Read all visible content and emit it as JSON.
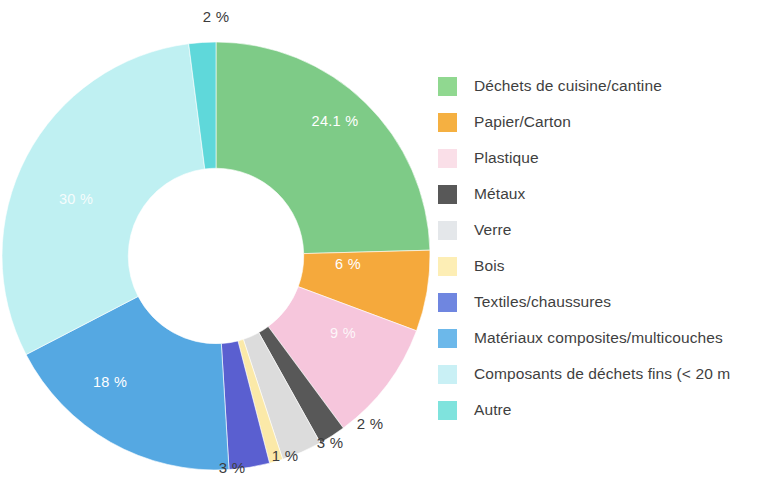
{
  "chart_data": {
    "type": "pie",
    "variant": "donut",
    "title": "",
    "subtitle": "",
    "xlabel": "",
    "ylabel": "",
    "units": "%",
    "legend_position": "right",
    "grid": false,
    "start_angle_deg": 0,
    "direction": "clockwise",
    "inner_radius_ratio": 0.41,
    "categories": [
      "Déchets de cuisine/cantine",
      "Papier/Carton",
      "Plastique",
      "Métaux",
      "Verre",
      "Bois",
      "Textiles/chaussures",
      "Matériaux composites/multicouches",
      "Composants de déchets fins (< 20 m",
      "Autre"
    ],
    "values": [
      24.1,
      6,
      9,
      2,
      3,
      1,
      3,
      18,
      30,
      2
    ],
    "data_labels": [
      "24.1 %",
      "6 %",
      "9 %",
      "2 %",
      "3 %",
      "1 %",
      "3 %",
      "18 %",
      "30 %",
      "2 %"
    ],
    "colors": [
      "#7ecb87",
      "#f5a93c",
      "#f6c6dc",
      "#585858",
      "#dcdcdc",
      "#fbe9a8",
      "#5a5fd0",
      "#55a8e2",
      "#bff0f2",
      "#5fd8da"
    ],
    "slices": [
      {
        "label": "Déchets de cuisine/cantine",
        "value": 24.1,
        "data_label": "24.1 %",
        "color": "#7ecb87",
        "label_placement": "inside"
      },
      {
        "label": "Papier/Carton",
        "value": 6,
        "data_label": "6 %",
        "color": "#f5a93c",
        "label_placement": "inside"
      },
      {
        "label": "Plastique",
        "value": 9,
        "data_label": "9 %",
        "color": "#f6c6dc",
        "label_placement": "inside"
      },
      {
        "label": "Métaux",
        "value": 2,
        "data_label": "2 %",
        "color": "#585858",
        "label_placement": "outside"
      },
      {
        "label": "Verre",
        "value": 3,
        "data_label": "3 %",
        "color": "#dcdcdc",
        "label_placement": "outside"
      },
      {
        "label": "Bois",
        "value": 1,
        "data_label": "1 %",
        "color": "#fbe9a8",
        "label_placement": "outside"
      },
      {
        "label": "Textiles/chaussures",
        "value": 3,
        "data_label": "3 %",
        "color": "#5a5fd0",
        "label_placement": "outside"
      },
      {
        "label": "Matériaux composites/multicouches",
        "value": 18,
        "data_label": "18 %",
        "color": "#55a8e2",
        "label_placement": "inside"
      },
      {
        "label": "Composants de déchets fins (< 20 m",
        "value": 30,
        "data_label": "30 %",
        "color": "#bff0f2",
        "label_placement": "inside"
      },
      {
        "label": "Autre",
        "value": 2,
        "data_label": "2 %",
        "color": "#5fd8da",
        "label_placement": "outside"
      }
    ]
  },
  "labels": {
    "green_24": "24.1 %",
    "orange_6": "6 %",
    "pink_9": "9 %",
    "metaux_2": "2 %",
    "verre_3": "3 %",
    "bois_1": "1 %",
    "textiles_3": "3 %",
    "composites_18": "18 %",
    "fins_30": "30 %",
    "autre_2": "2 %"
  },
  "legend": {
    "items": [
      {
        "label": "Déchets de cuisine/cantine",
        "color": "#90d890"
      },
      {
        "label": "Papier/Carton",
        "color": "#f5b041"
      },
      {
        "label": "Plastique",
        "color": "#fadfe8"
      },
      {
        "label": "Métaux",
        "color": "#585858"
      },
      {
        "label": "Verre",
        "color": "#e4e7ea"
      },
      {
        "label": "Bois",
        "color": "#fdeeb5"
      },
      {
        "label": "Textiles/chaussures",
        "color": "#6f86e0"
      },
      {
        "label": "Matériaux composites/multicouches",
        "color": "#6cb8ea"
      },
      {
        "label": "Composants de déchets fins (< 20 m",
        "color": "#c9f0f5"
      },
      {
        "label": "Autre",
        "color": "#7fe3dd"
      }
    ]
  }
}
